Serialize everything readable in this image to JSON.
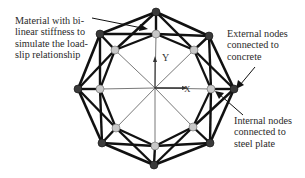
{
  "labels": {
    "material": "Material with bi-\nlinear stiffness to\nsimulate the load-\nslip relationship",
    "external": "External nodes\nconnected to\nconcrete",
    "internal": "Internal nodes\nconnected to\nsteel plate",
    "axis_y": "Y",
    "axis_x": "X"
  },
  "legend": {
    "external_node_color": "#3a3a3a",
    "internal_node_color": "#c8c8c8",
    "spring_color": "#111111",
    "spoke_color": "#555555"
  },
  "structure": {
    "outer_node_count": 8,
    "inner_node_count": 8
  }
}
